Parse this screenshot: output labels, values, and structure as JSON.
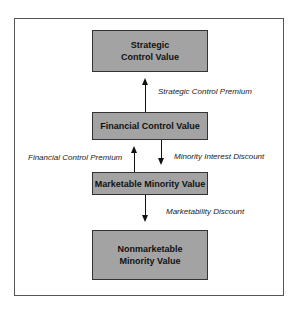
{
  "diagram": {
    "nodes": [
      {
        "id": "strategic",
        "lines": [
          "Strategic",
          "Control Value"
        ]
      },
      {
        "id": "financial",
        "lines": [
          "Financial Control Value"
        ]
      },
      {
        "id": "marketable",
        "lines": [
          "Marketable Minority Value"
        ]
      },
      {
        "id": "nonmarketable",
        "lines": [
          "Nonmarketable",
          "Minority Value"
        ]
      }
    ],
    "edges": [
      {
        "from": "financial",
        "to": "strategic",
        "label": "Strategic Control Premium"
      },
      {
        "from": "marketable",
        "to": "financial",
        "label": "Financial Control Premium"
      },
      {
        "from": "financial",
        "to": "marketable",
        "label": "Minority Interest Discount"
      },
      {
        "from": "marketable",
        "to": "nonmarketable",
        "label": "Marketability Discount"
      }
    ],
    "colors": {
      "box_fill": "#a3a3a3",
      "border": "#333333",
      "frame": "#555555"
    }
  }
}
